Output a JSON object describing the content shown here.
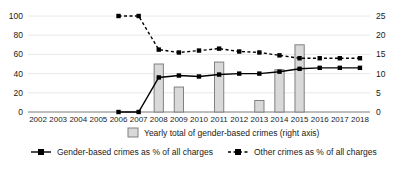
{
  "chart_data": {
    "type": "bar",
    "title": "",
    "subtitle": "",
    "xlabel": "",
    "ylabel": "",
    "y2label": "",
    "grid": true,
    "legend_position": "bottom",
    "categories": [
      "2002",
      "2003",
      "2004",
      "2005",
      "2006",
      "2007",
      "2008",
      "2009",
      "2010",
      "2011",
      "2012",
      "2013",
      "2014",
      "2015",
      "2016",
      "2017",
      "2018"
    ],
    "ylim": [
      0,
      100
    ],
    "yticks": [
      0,
      20,
      40,
      60,
      80,
      100
    ],
    "y2lim": [
      0,
      25
    ],
    "y2ticks": [
      0,
      5,
      10,
      15,
      20,
      25
    ],
    "series": [
      {
        "name": "Yearly total of gender-based crimes (right axis)",
        "type": "bar",
        "axis": "right",
        "color": "#d9d9d9",
        "edge_color": "#808080",
        "values": [
          null,
          null,
          null,
          null,
          null,
          null,
          12.5,
          6.5,
          null,
          13.0,
          null,
          3.0,
          11.0,
          17.5,
          null,
          null,
          null
        ]
      },
      {
        "name": "Gender-based crimes as % of all charges",
        "type": "line",
        "axis": "left",
        "style": "solid",
        "color": "#000000",
        "marker": "square",
        "values": [
          null,
          null,
          null,
          null,
          0,
          0,
          36,
          38,
          37,
          39,
          40,
          40,
          42,
          45,
          46,
          46,
          46
        ]
      },
      {
        "name": "Other crimes as % of all charges",
        "type": "line",
        "axis": "left",
        "style": "dashed",
        "color": "#000000",
        "marker": "square",
        "values": [
          null,
          null,
          null,
          null,
          100,
          100,
          65,
          62,
          64,
          66,
          63,
          62,
          59,
          56,
          56,
          56,
          56
        ]
      }
    ]
  },
  "axes": {
    "left_ticks": [
      "100",
      "80",
      "60",
      "40",
      "20",
      "0"
    ],
    "right_ticks": [
      "25",
      "20",
      "15",
      "10",
      "5",
      "0"
    ],
    "x_ticks": [
      "2002",
      "2003",
      "2004",
      "2005",
      "2006",
      "2007",
      "2008",
      "2009",
      "2010",
      "2011",
      "2012",
      "2013",
      "2014",
      "2015",
      "2016",
      "2017",
      "2018"
    ]
  },
  "legend": {
    "items": [
      {
        "label": "Yearly total of gender-based crimes (right axis)",
        "marker": "bar-swatch"
      },
      {
        "label": "Gender-based crimes as % of all charges",
        "marker": "solid-line-square"
      },
      {
        "label": "Other crimes as % of all charges",
        "marker": "dashed-line-square"
      }
    ]
  }
}
